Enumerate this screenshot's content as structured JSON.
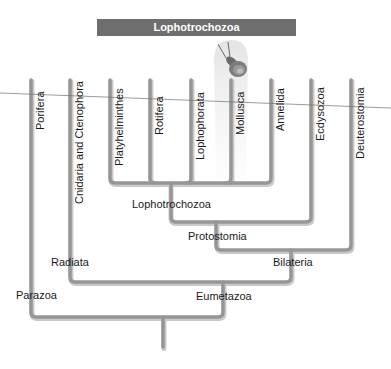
{
  "header": {
    "title": "Lophotrochozoa",
    "color": "#6e6e6e"
  },
  "illustration": {
    "name": "snail",
    "highlight_taxon": "Mollusca"
  },
  "taxa": [
    {
      "label": "Porifera",
      "x": 31
    },
    {
      "label": "Cnidaria and Ctenophora",
      "x": 70
    },
    {
      "label": "Platyhelminthes",
      "x": 110
    },
    {
      "label": "Rotifera",
      "x": 150
    },
    {
      "label": "Lophophorata",
      "x": 191
    },
    {
      "label": "Mollusca",
      "x": 231
    },
    {
      "label": "Annelida",
      "x": 271
    },
    {
      "label": "Ecdysozoa",
      "x": 311
    },
    {
      "label": "Deuterostomia",
      "x": 351
    }
  ],
  "clades": {
    "lophotrochozoa": "Lophotrochozoa",
    "protostomia": "Protostomia",
    "bilateria": "Bilateria",
    "radiata": "Radiata",
    "eumetazoa": "Eumetazoa",
    "parazoa": "Parazoa"
  },
  "colors": {
    "branch": "#9a9a9a",
    "branch_shadow": "#c8c8c8",
    "highlight": "#ececec",
    "rule": "#707070"
  }
}
